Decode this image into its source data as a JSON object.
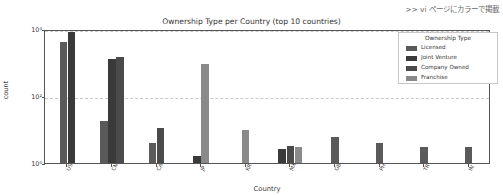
{
  "annotation": ">> vi ページにカラーで掲載",
  "chart_data": {
    "type": "bar",
    "title": "Ownership Type per Country (top 10 countries)",
    "xlabel": "Country",
    "ylabel": "count",
    "yscale": "log",
    "ylim": [
      1,
      10000
    ],
    "ytick_labels": [
      "10⁰",
      "10²",
      "10⁴"
    ],
    "ytick_values": [
      1,
      100,
      10000
    ],
    "grid": true,
    "legend_title": "Ownership Type",
    "legend_position": "upper right",
    "categories": [
      "US",
      "CN",
      "CA",
      "JP",
      "KR",
      "MX",
      "GB",
      "PH",
      "TR",
      "IN"
    ],
    "series": [
      {
        "name": "Licensed",
        "color": "#5a5a5a",
        "values": [
          4000,
          18,
          4,
          null,
          null,
          null,
          3,
          4,
          3,
          3
        ]
      },
      {
        "name": "Joint Venture",
        "color": "#3a3a3a",
        "values": [
          8200,
          1300,
          null,
          5,
          null,
          2.6,
          null,
          null,
          null,
          null
        ]
      },
      {
        "name": "Company Owned",
        "color": "#4a4a4a",
        "values": [
          null,
          1500,
          11,
          null,
          null,
          3.2,
          null,
          null,
          null,
          null
        ]
      },
      {
        "name": "Franchise",
        "color": "#8a8a8a",
        "values": [
          null,
          null,
          null,
          900,
          10,
          3.0,
          6,
          null,
          null,
          null
        ]
      }
    ],
    "bars": [
      {
        "group": 0,
        "series": "Licensed",
        "value": 4000
      },
      {
        "group": 0,
        "series": "Joint Venture",
        "value": 8200
      },
      {
        "group": 1,
        "series": "Licensed",
        "value": 18
      },
      {
        "group": 1,
        "series": "Joint Venture",
        "value": 1300
      },
      {
        "group": 1,
        "series": "Company Owned",
        "value": 1500
      },
      {
        "group": 2,
        "series": "Licensed",
        "value": 4
      },
      {
        "group": 2,
        "series": "Company Owned",
        "value": 11
      },
      {
        "group": 3,
        "series": "Joint Venture",
        "value": 1.6
      },
      {
        "group": 3,
        "series": "Franchise",
        "value": 900
      },
      {
        "group": 4,
        "series": "Franchise",
        "value": 10
      },
      {
        "group": 5,
        "series": "Joint Venture",
        "value": 2.6
      },
      {
        "group": 5,
        "series": "Company Owned",
        "value": 3.2
      },
      {
        "group": 5,
        "series": "Franchise",
        "value": 3.0
      },
      {
        "group": 6,
        "series": "Licensed",
        "value": 6
      },
      {
        "group": 7,
        "series": "Licensed",
        "value": 4
      },
      {
        "group": 8,
        "series": "Licensed",
        "value": 3
      },
      {
        "group": 9,
        "series": "Licensed",
        "value": 3
      }
    ]
  }
}
